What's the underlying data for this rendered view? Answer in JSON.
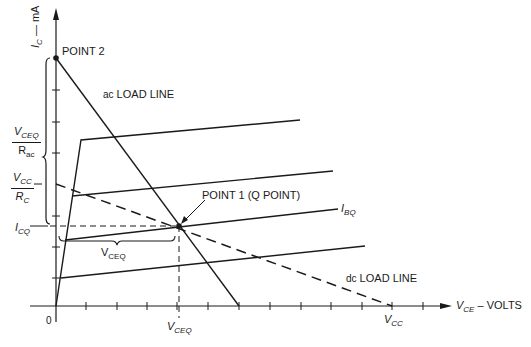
{
  "diagram": {
    "y_axis": {
      "main": "I",
      "sub": "C",
      "unit": " — mA"
    },
    "x_axis": {
      "main": "V",
      "sub": "CE",
      "unit": " – VOLTS"
    },
    "origin_label": "0",
    "points": {
      "point2": "POINT 2",
      "point1": "POINT 1  (Q POINT)"
    },
    "lines": {
      "ac_load_line": {
        "prefix": "ac",
        "label": " LOAD LINE"
      },
      "dc_load_line": {
        "prefix": "dc",
        "label": " LOAD LINE"
      }
    },
    "labels": {
      "ibq": {
        "main": "I",
        "sub": "BQ"
      },
      "icq": {
        "main": "I",
        "sub": "CQ"
      },
      "vceq_axis": {
        "main": "V",
        "sub": "CEQ"
      },
      "vceq_brace": {
        "main": "V",
        "sub": "CEQ"
      },
      "vcc_axis": {
        "main": "V",
        "sub": "CC"
      },
      "vceq_over_rac": {
        "num_main": "V",
        "num_sub": "CEQ",
        "den_main": "R",
        "den_sub": "ac"
      },
      "vcc_over_rc": {
        "num_main": "V",
        "num_sub": "CC",
        "den_main": "R",
        "den_sub": "C"
      }
    },
    "colors": {
      "ink": "#1a1a1a",
      "background": "#ffffff"
    }
  }
}
